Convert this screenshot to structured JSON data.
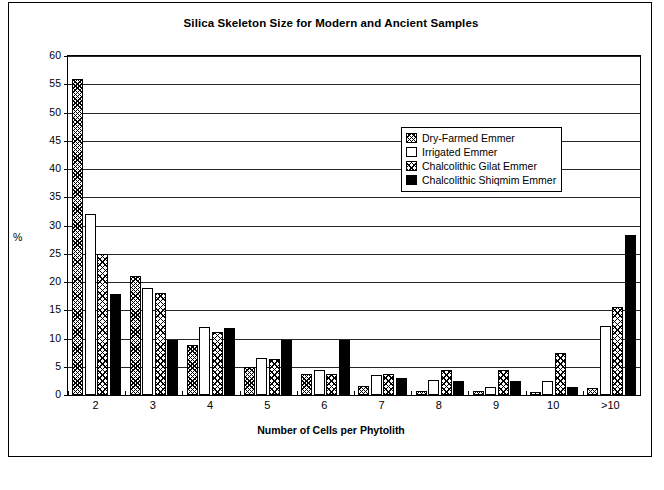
{
  "chart_data": {
    "type": "bar",
    "title": "Silica Skeleton Size for Modern and Ancient Samples",
    "xlabel": "Number of Cells per Phytolith",
    "ylabel": "%",
    "categories": [
      "2",
      "3",
      "4",
      "5",
      "6",
      "7",
      "8",
      "9",
      "10",
      ">10"
    ],
    "ylim": [
      0,
      60
    ],
    "yticks": [
      0,
      5,
      10,
      15,
      20,
      25,
      30,
      35,
      40,
      45,
      50,
      55,
      60
    ],
    "grid": true,
    "legend_position": "upper-center-right",
    "series": [
      {
        "name": "Dry-Farmed Emmer",
        "fill": "cross-hatch-dense",
        "values": [
          56.0,
          21.0,
          8.9,
          4.9,
          3.8,
          1.6,
          0.7,
          0.7,
          0.6,
          1.2
        ]
      },
      {
        "name": "Irrigated Emmer",
        "fill": "white",
        "values": [
          32.0,
          19.0,
          12.1,
          6.6,
          4.5,
          3.5,
          2.6,
          1.5,
          2.4,
          12.3
        ]
      },
      {
        "name": "Chalcolithic Gilat Emmer",
        "fill": "cross-hatch",
        "values": [
          25.0,
          18.0,
          11.1,
          6.3,
          3.7,
          3.7,
          4.5,
          4.4,
          7.4,
          15.5
        ]
      },
      {
        "name": "Chalcolithic Shiqmim Emmer",
        "fill": "solid-black",
        "values": [
          17.9,
          9.8,
          11.9,
          9.8,
          9.8,
          3.0,
          2.4,
          2.4,
          1.4,
          28.4
        ]
      }
    ]
  },
  "caption": ""
}
